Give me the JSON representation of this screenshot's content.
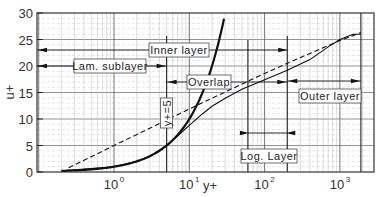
{
  "chart_data": {
    "type": "line",
    "title": "",
    "xlabel": "y+",
    "ylabel": "u+",
    "xscale": "log",
    "xlim": [
      0.16,
      2200
    ],
    "ylim": [
      0,
      30
    ],
    "yticks": [
      0,
      5,
      10,
      15,
      20,
      25,
      30
    ],
    "xticks": [
      {
        "value": 1,
        "label": "10",
        "exp": "0"
      },
      {
        "value": 10,
        "label": "10",
        "exp": "1"
      },
      {
        "value": 100,
        "label": "10",
        "exp": "2"
      },
      {
        "value": 1000,
        "label": "10",
        "exp": "3"
      }
    ],
    "grid": true,
    "series": [
      {
        "name": "linear law u+=y+",
        "style": "thick-solid",
        "x": [
          0.2,
          0.5,
          1,
          2,
          3,
          4,
          5,
          6,
          8,
          10,
          13,
          16,
          20,
          25,
          29
        ],
        "y": [
          0.2,
          0.5,
          1,
          2,
          3,
          4,
          5,
          6,
          8,
          10,
          13,
          16,
          20,
          25,
          29
        ]
      },
      {
        "name": "log law",
        "style": "dashed",
        "x": [
          0.25,
          1,
          5,
          10,
          30,
          100,
          300,
          1000,
          1900
        ],
        "y": [
          0.8,
          5.0,
          9.8,
          11.9,
          15.1,
          18.6,
          21.6,
          24.8,
          26.3
        ]
      },
      {
        "name": "velocity profile",
        "style": "thin-solid",
        "x": [
          0.2,
          1,
          2,
          3,
          5,
          7,
          10,
          15,
          20,
          30,
          50,
          100,
          200,
          400,
          700,
          1000,
          1500,
          1900
        ],
        "y": [
          0.2,
          1,
          2,
          3,
          5,
          6.8,
          8.8,
          11.0,
          12.4,
          13.9,
          15.6,
          17.4,
          19.2,
          21.2,
          23.6,
          25.0,
          26.0,
          26.0
        ]
      }
    ],
    "annotations": [
      {
        "text": "Inner layer",
        "x_range": [
          0.16,
          200
        ],
        "y": 23
      },
      {
        "text": "Lam. sublayer",
        "x_range": [
          0.16,
          5
        ],
        "y": 20
      },
      {
        "text": "Overlap",
        "x_range": [
          5,
          200
        ],
        "y": 17
      },
      {
        "text": "y+=5",
        "x": 5,
        "orientation": "vertical"
      },
      {
        "text": "Log. Layer",
        "x_range": [
          60,
          200
        ],
        "y": 7.5
      },
      {
        "text": "Outer layer",
        "x_range": [
          200,
          1900
        ],
        "y": 17
      }
    ],
    "vertical_lines": [
      5,
      60,
      200,
      1900
    ]
  }
}
